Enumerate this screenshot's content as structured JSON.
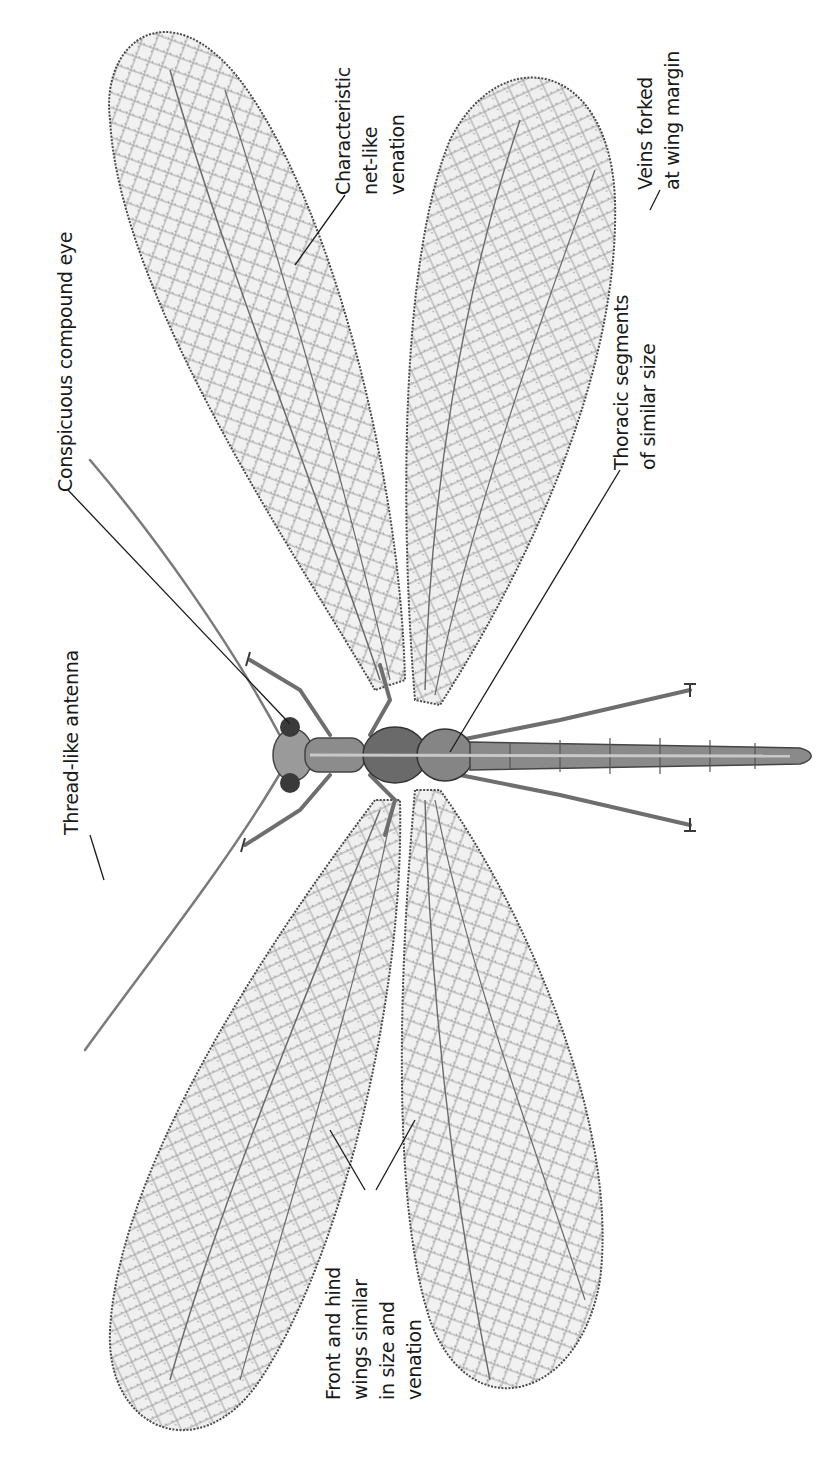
{
  "figure": {
    "orientation": "rotated-90-ccw",
    "colors": {
      "background": "#ffffff",
      "ink": "#1a1a1a",
      "wing_fill": "#ececec",
      "wing_shade": "#d6d6d6",
      "vein": "#5a5a5a",
      "body": "#8a8a8a",
      "body_dark": "#555555"
    }
  },
  "labels": {
    "antenna": {
      "lines": [
        "Thread-like antenna"
      ]
    },
    "compound_eye": {
      "lines": [
        "Conspicuous compound eye"
      ]
    },
    "venation": {
      "lines": [
        "Characteristic",
        "net-like",
        "venation"
      ]
    },
    "thoracic": {
      "lines": [
        "Thoracic segments",
        "of similar size"
      ]
    },
    "veins_forked": {
      "lines": [
        "Veins forked",
        "at wing margin"
      ]
    },
    "wings_similar": {
      "lines": [
        "Front and hind",
        "wings similar",
        "in size and",
        "venation"
      ]
    }
  }
}
